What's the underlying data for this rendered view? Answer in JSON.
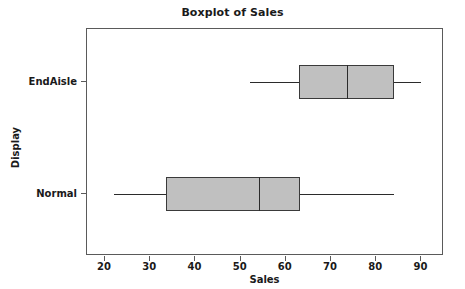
{
  "chart_data": {
    "type": "box",
    "title": "Boxplot of Sales",
    "xlabel": "Sales",
    "ylabel": "Display",
    "orientation": "horizontal",
    "xlim": [
      16,
      95
    ],
    "xticks": [
      20,
      30,
      40,
      50,
      60,
      70,
      80,
      90
    ],
    "xtick_labels": [
      "20",
      "30",
      "40",
      "50",
      "60",
      "70",
      "80",
      "90"
    ],
    "categories": [
      "EndAisle",
      "Normal"
    ],
    "grid": false,
    "legend": false,
    "boxes": [
      {
        "label": "EndAisle",
        "whisker_low": 52,
        "q1": 63,
        "median": 73.6,
        "q3": 84,
        "whisker_high": 90,
        "fill": "#c0c0c0",
        "stroke": "#3a3a3a"
      },
      {
        "label": "Normal",
        "whisker_low": 22,
        "q1": 33.4,
        "median": 54,
        "q3": 63.2,
        "whisker_high": 84,
        "fill": "#c0c0c0",
        "stroke": "#3a3a3a"
      }
    ]
  },
  "colors": {
    "frame": "#5a5a5a",
    "ink": "#1a1a1a",
    "box_fill": "#c0c0c0",
    "box_stroke": "#3a3a3a",
    "background": "#ffffff"
  }
}
